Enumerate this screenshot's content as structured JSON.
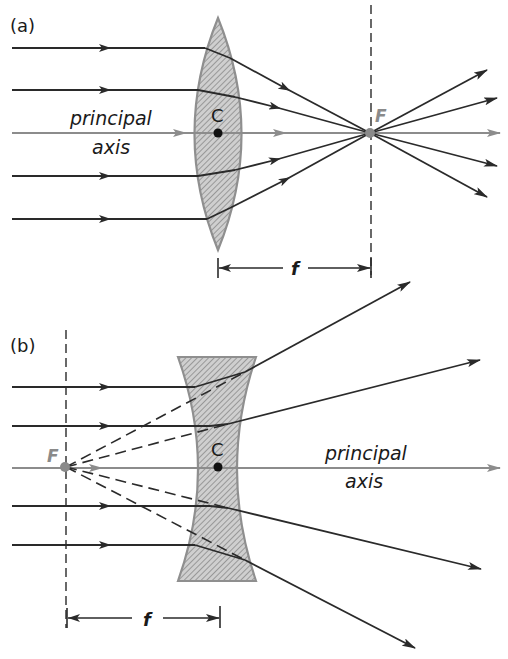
{
  "figure": {
    "colors": {
      "ray": "#2a2a2a",
      "axis": "#8c8c8c",
      "lens_fill": "#c4c4c4",
      "lens_edge": "#8f8f8f",
      "hatch": "#777777",
      "focal_point": "#8a8a8a"
    },
    "panel_a": {
      "label": "(a)",
      "lens_type": "converging",
      "axis_label_line1": "principal",
      "axis_label_line2": "axis",
      "center_label": "C",
      "focal_label": "F",
      "focal_length_label": "f",
      "incident_rays": 5
    },
    "panel_b": {
      "label": "(b)",
      "lens_type": "diverging",
      "axis_label_line1": "principal",
      "axis_label_line2": "axis",
      "center_label": "C",
      "focal_label": "F",
      "focal_length_label": "f",
      "incident_rays": 5
    }
  }
}
